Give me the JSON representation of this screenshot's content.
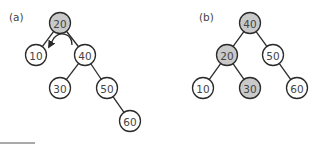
{
  "colors": {
    "highlight_fill": "#c9c9c9",
    "normal_fill": "#ffffff",
    "stroke": "#2a2a2a",
    "text": "#444444"
  },
  "node_radius": 10.5,
  "panels": [
    {
      "label": "(a)",
      "label_pos": [
        9,
        21
      ],
      "nodes": [
        {
          "id": "a20",
          "value": "20",
          "x": 60,
          "y": 23,
          "highlighted": true
        },
        {
          "id": "a10",
          "value": "10",
          "x": 36,
          "y": 55,
          "highlighted": false
        },
        {
          "id": "a40",
          "value": "40",
          "x": 85,
          "y": 55,
          "highlighted": false
        },
        {
          "id": "a30",
          "value": "30",
          "x": 60,
          "y": 88,
          "highlighted": false
        },
        {
          "id": "a50",
          "value": "50",
          "x": 107,
          "y": 88,
          "highlighted": false
        },
        {
          "id": "a60",
          "value": "60",
          "x": 130,
          "y": 121,
          "highlighted": false
        }
      ],
      "edges": [
        [
          "a20",
          "a10"
        ],
        [
          "a20",
          "a40"
        ],
        [
          "a40",
          "a30"
        ],
        [
          "a40",
          "a50"
        ],
        [
          "a50",
          "a60"
        ]
      ],
      "annotation": "left-rotation-arrow"
    },
    {
      "label": "(b)",
      "label_pos": [
        199,
        21
      ],
      "nodes": [
        {
          "id": "b40",
          "value": "40",
          "x": 250,
          "y": 23,
          "highlighted": true
        },
        {
          "id": "b20",
          "value": "20",
          "x": 227,
          "y": 55,
          "highlighted": true
        },
        {
          "id": "b50",
          "value": "50",
          "x": 273,
          "y": 55,
          "highlighted": false
        },
        {
          "id": "b10",
          "value": "10",
          "x": 203,
          "y": 88,
          "highlighted": false
        },
        {
          "id": "b30",
          "value": "30",
          "x": 250,
          "y": 88,
          "highlighted": true
        },
        {
          "id": "b60",
          "value": "60",
          "x": 297,
          "y": 88,
          "highlighted": false
        }
      ],
      "edges": [
        [
          "b40",
          "b20"
        ],
        [
          "b40",
          "b50"
        ],
        [
          "b20",
          "b10"
        ],
        [
          "b20",
          "b30"
        ],
        [
          "b50",
          "b60"
        ]
      ]
    }
  ]
}
